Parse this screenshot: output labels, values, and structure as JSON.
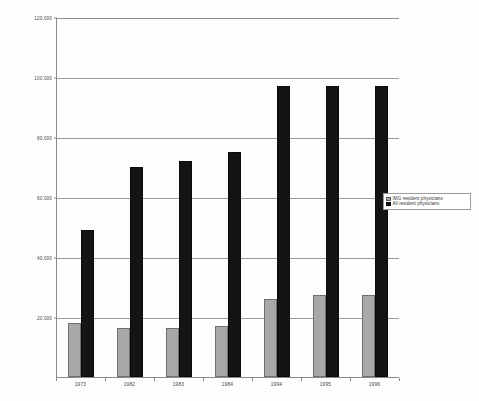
{
  "chart_data": {
    "type": "bar",
    "title": "",
    "subtitle": "",
    "xlabel": "",
    "ylabel": "",
    "categories": [
      "1973",
      "1982",
      "1983",
      "1984",
      "1994",
      "1995",
      "1996"
    ],
    "series": [
      {
        "name": "IMG resident physicians",
        "color": "#a8a8a8",
        "values": [
          18000,
          16500,
          16500,
          17000,
          26000,
          27500,
          27500
        ]
      },
      {
        "name": "All resident physicians",
        "color": "#141414",
        "values": [
          49000,
          70000,
          72000,
          75000,
          97000,
          97000,
          97000
        ]
      }
    ],
    "ylim": [
      0,
      120000
    ],
    "ytick_values": [
      0,
      20000,
      40000,
      60000,
      80000,
      100000,
      120000
    ],
    "ytick_labels": [
      "",
      "20,000",
      "40,000",
      "60,000",
      "80,000",
      "100,000",
      "120,000"
    ],
    "grid": true,
    "grid_axis": "y",
    "legend_position": "right-middle",
    "annotations": []
  },
  "legend": {
    "entries": [
      {
        "label": "IMG resident physicians",
        "swatch": "img-swatch"
      },
      {
        "label": "All resident physicians",
        "swatch": "all-swatch"
      }
    ]
  },
  "axes": {
    "y": {
      "ticks": [
        {
          "value": 120000,
          "label": "120,000"
        },
        {
          "value": 100000,
          "label": "100,000"
        },
        {
          "value": 80000,
          "label": "80,000"
        },
        {
          "value": 60000,
          "label": "60,000"
        },
        {
          "value": 40000,
          "label": "40,000"
        },
        {
          "value": 20000,
          "label": "20,000"
        }
      ]
    },
    "x": {
      "ticks": [
        {
          "label": "1973"
        },
        {
          "label": "1982"
        },
        {
          "label": "1983"
        },
        {
          "label": "1984"
        },
        {
          "label": "1994"
        },
        {
          "label": "1995"
        },
        {
          "label": "1996"
        }
      ]
    }
  }
}
